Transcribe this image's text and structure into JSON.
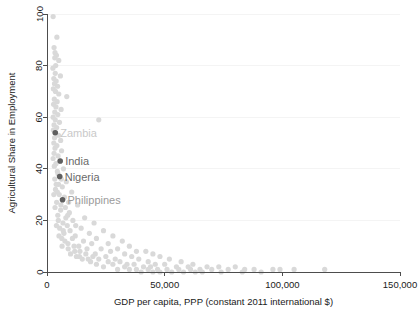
{
  "chart_data": {
    "type": "scatter",
    "title": "",
    "xlabel": "GDP per capita, PPP (constant 2011 international $)",
    "ylabel": "Agricultural Share in Employment",
    "xlim": [
      0,
      150000
    ],
    "ylim": [
      0,
      100
    ],
    "xticks": [
      0,
      50000,
      100000,
      150000
    ],
    "xticklabels": [
      "0",
      "50,000",
      "100,000",
      "150,000"
    ],
    "yticks": [
      0,
      20,
      40,
      60,
      80,
      100
    ],
    "yticklabels": [
      "0",
      "20",
      "40",
      "60",
      "80",
      "100"
    ],
    "grid": "horizontal-faint",
    "legend": "none",
    "marker_color": "#d9d9d9",
    "highlight_color": "#5f5f5f",
    "annotations": [
      {
        "label": "Zambia",
        "x": 3500,
        "y": 54,
        "color": "#c9c9c9"
      },
      {
        "label": "India",
        "x": 5600,
        "y": 43,
        "color": "#6a6a6a"
      },
      {
        "label": "Nigeria",
        "x": 5400,
        "y": 37,
        "color": "#6a6a6a"
      },
      {
        "label": "Philippines",
        "x": 6600,
        "y": 28,
        "color": "#9b9b9b"
      }
    ],
    "points": [
      [
        2600,
        99
      ],
      [
        4200,
        91
      ],
      [
        3000,
        87
      ],
      [
        3400,
        85
      ],
      [
        4000,
        84
      ],
      [
        3300,
        83
      ],
      [
        5000,
        82
      ],
      [
        3700,
        80
      ],
      [
        2500,
        79
      ],
      [
        3500,
        77
      ],
      [
        5700,
        76
      ],
      [
        2900,
        75
      ],
      [
        3900,
        74
      ],
      [
        3200,
        73
      ],
      [
        4500,
        72
      ],
      [
        2700,
        71
      ],
      [
        3600,
        70
      ],
      [
        5000,
        69
      ],
      [
        8400,
        68
      ],
      [
        3100,
        67
      ],
      [
        4300,
        66
      ],
      [
        2800,
        65
      ],
      [
        3800,
        64
      ],
      [
        6000,
        63
      ],
      [
        3300,
        62
      ],
      [
        4600,
        61
      ],
      [
        2600,
        60
      ],
      [
        3500,
        59
      ],
      [
        22000,
        59
      ],
      [
        5300,
        58
      ],
      [
        3000,
        57
      ],
      [
        4100,
        56
      ],
      [
        2700,
        55
      ],
      [
        3600,
        54
      ],
      [
        4900,
        53
      ],
      [
        3200,
        52
      ],
      [
        5800,
        51
      ],
      [
        2900,
        50
      ],
      [
        4200,
        49
      ],
      [
        3400,
        48
      ],
      [
        6200,
        47
      ],
      [
        3000,
        46
      ],
      [
        4700,
        45
      ],
      [
        2600,
        44
      ],
      [
        5600,
        43
      ],
      [
        3800,
        42
      ],
      [
        3100,
        41
      ],
      [
        7000,
        40
      ],
      [
        4400,
        39
      ],
      [
        5400,
        37
      ],
      [
        3300,
        36
      ],
      [
        8200,
        35
      ],
      [
        4900,
        34
      ],
      [
        6500,
        33
      ],
      [
        3600,
        32
      ],
      [
        10500,
        31
      ],
      [
        5200,
        30
      ],
      [
        6600,
        28
      ],
      [
        4100,
        27
      ],
      [
        13000,
        26
      ],
      [
        7800,
        25
      ],
      [
        5800,
        24
      ],
      [
        9500,
        23
      ],
      [
        4600,
        22
      ],
      [
        16000,
        21
      ],
      [
        11000,
        20
      ],
      [
        6800,
        19
      ],
      [
        20000,
        19
      ],
      [
        8600,
        18
      ],
      [
        5400,
        17
      ],
      [
        14500,
        17
      ],
      [
        9800,
        16
      ],
      [
        24000,
        16
      ],
      [
        7200,
        15
      ],
      [
        18000,
        15
      ],
      [
        12000,
        14
      ],
      [
        28000,
        14
      ],
      [
        6300,
        13
      ],
      [
        10800,
        13
      ],
      [
        21000,
        13
      ],
      [
        15500,
        12
      ],
      [
        32000,
        12
      ],
      [
        8900,
        11
      ],
      [
        19000,
        11
      ],
      [
        26000,
        11
      ],
      [
        13500,
        10
      ],
      [
        35000,
        10
      ],
      [
        11500,
        10
      ],
      [
        23000,
        9
      ],
      [
        30000,
        9
      ],
      [
        17000,
        9
      ],
      [
        38000,
        8
      ],
      [
        14000,
        8
      ],
      [
        27000,
        8
      ],
      [
        42000,
        8
      ],
      [
        20500,
        7
      ],
      [
        33000,
        7
      ],
      [
        16500,
        7
      ],
      [
        45000,
        7
      ],
      [
        25000,
        6
      ],
      [
        36000,
        6
      ],
      [
        19500,
        6
      ],
      [
        48000,
        6
      ],
      [
        29000,
        5
      ],
      [
        39000,
        5
      ],
      [
        22000,
        5
      ],
      [
        52000,
        5
      ],
      [
        31000,
        4
      ],
      [
        43000,
        4
      ],
      [
        26000,
        4
      ],
      [
        57000,
        4
      ],
      [
        34000,
        3
      ],
      [
        46000,
        3
      ],
      [
        28000,
        3
      ],
      [
        62000,
        3
      ],
      [
        37000,
        3
      ],
      [
        50000,
        3
      ],
      [
        68000,
        2
      ],
      [
        41000,
        2
      ],
      [
        55000,
        2
      ],
      [
        33000,
        2
      ],
      [
        73000,
        2
      ],
      [
        44000,
        2
      ],
      [
        60000,
        2
      ],
      [
        80000,
        2
      ],
      [
        47000,
        1
      ],
      [
        65000,
        1
      ],
      [
        38000,
        1
      ],
      [
        88000,
        1
      ],
      [
        51000,
        1
      ],
      [
        70000,
        1
      ],
      [
        96000,
        1
      ],
      [
        56000,
        1
      ],
      [
        77000,
        1
      ],
      [
        118000,
        1
      ],
      [
        43000,
        1
      ],
      [
        61000,
        1
      ],
      [
        84000,
        1
      ],
      [
        99000,
        1
      ],
      [
        66000,
        0
      ],
      [
        48000,
        0
      ],
      [
        91000,
        0
      ],
      [
        74000,
        0
      ],
      [
        58000,
        0
      ],
      [
        40000,
        0
      ],
      [
        35000,
        1
      ],
      [
        30000,
        1
      ],
      [
        24000,
        2
      ],
      [
        21000,
        3
      ],
      [
        18500,
        4
      ],
      [
        15000,
        5
      ],
      [
        12500,
        6
      ],
      [
        10000,
        7
      ],
      [
        9000,
        9
      ],
      [
        7600,
        12
      ],
      [
        6900,
        16
      ],
      [
        8000,
        21
      ],
      [
        11800,
        8
      ],
      [
        13800,
        6
      ],
      [
        17500,
        5
      ],
      [
        45000,
        0
      ],
      [
        53000,
        0
      ],
      [
        63000,
        0
      ],
      [
        83000,
        0
      ],
      [
        105000,
        1
      ],
      [
        4800,
        20
      ],
      [
        5900,
        26
      ],
      [
        4400,
        31
      ],
      [
        7400,
        29
      ],
      [
        9200,
        27
      ],
      [
        3900,
        34
      ],
      [
        6100,
        36
      ],
      [
        4700,
        38
      ],
      [
        8800,
        22
      ],
      [
        12200,
        18
      ],
      [
        2900,
        30
      ],
      [
        3400,
        25
      ],
      [
        4000,
        18
      ],
      [
        5100,
        14
      ],
      [
        6400,
        10
      ]
    ]
  }
}
